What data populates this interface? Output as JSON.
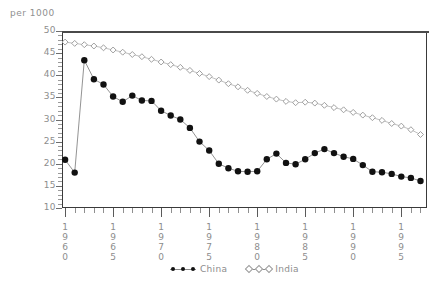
{
  "chart_data": {
    "type": "line",
    "title": "",
    "ylabel": "per 1000",
    "xlabel": "",
    "ylim": [
      10,
      50
    ],
    "xlim": [
      1960,
      1997
    ],
    "grid": false,
    "legend_position": "bottom-center",
    "y_ticks": [
      50,
      45,
      40,
      35,
      30,
      25,
      20,
      15,
      10
    ],
    "x_ticks": [
      1960,
      1965,
      1970,
      1975,
      1980,
      1985,
      1990,
      1995
    ],
    "x": [
      1960,
      1961,
      1962,
      1963,
      1964,
      1965,
      1966,
      1967,
      1968,
      1969,
      1970,
      1971,
      1972,
      1973,
      1974,
      1975,
      1976,
      1977,
      1978,
      1979,
      1980,
      1981,
      1982,
      1983,
      1984,
      1985,
      1986,
      1987,
      1988,
      1989,
      1990,
      1991,
      1992,
      1993,
      1994,
      1995,
      1996,
      1997
    ],
    "series": [
      {
        "name": "China",
        "marker": "filled-circle",
        "color": "#111111",
        "values": [
          20.9,
          18.0,
          43.4,
          39.1,
          37.9,
          35.2,
          34.0,
          35.4,
          34.3,
          34.2,
          32.0,
          30.9,
          30.0,
          28.1,
          25.0,
          23.0,
          20.0,
          19.0,
          18.3,
          18.2,
          18.3,
          21.0,
          22.3,
          20.2,
          19.9,
          21.0,
          22.4,
          23.3,
          22.4,
          21.6,
          21.1,
          19.7,
          18.2,
          18.1,
          17.7,
          17.1,
          16.8,
          16.1
        ]
      },
      {
        "name": "India",
        "marker": "open-diamond",
        "color": "#9a9a9a",
        "values": [
          47.5,
          47.2,
          46.9,
          46.6,
          46.2,
          45.7,
          45.2,
          44.7,
          44.2,
          43.6,
          43.0,
          42.4,
          41.8,
          41.1,
          40.4,
          39.7,
          38.9,
          38.1,
          37.4,
          36.6,
          35.9,
          35.2,
          34.6,
          34.1,
          33.8,
          33.9,
          33.7,
          33.2,
          32.7,
          32.2,
          31.6,
          31.0,
          30.4,
          29.8,
          29.1,
          28.5,
          27.7,
          26.6
        ]
      }
    ]
  },
  "legend": {
    "items": [
      {
        "label": "China",
        "key": "filled-circle"
      },
      {
        "label": "India",
        "key": "open-diamond"
      }
    ]
  },
  "axis": {
    "y_title": "per 1000"
  }
}
